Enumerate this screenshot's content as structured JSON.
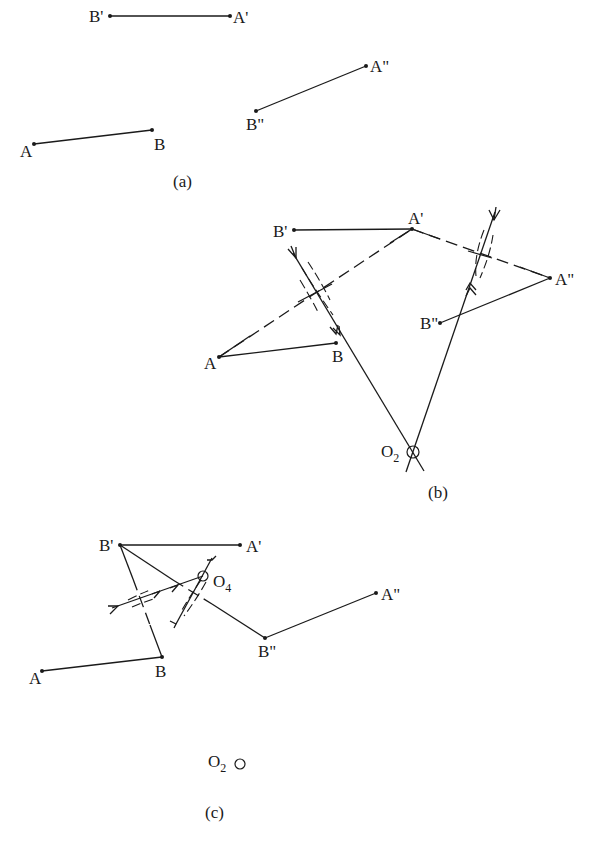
{
  "panels": [
    {
      "caption": "(a)",
      "points": {
        "A": "A",
        "B": "B",
        "A1": "A'",
        "B1": "B'",
        "A2": "A\"",
        "B2": "B\""
      }
    },
    {
      "caption": "(b)",
      "points": {
        "A": "A",
        "B": "B",
        "A1": "A'",
        "B1": "B'",
        "A2": "A\"",
        "B2": "B\""
      },
      "center": {
        "letter": "O",
        "subscript": "2"
      }
    },
    {
      "caption": "(c)",
      "points": {
        "A": "A",
        "B": "B",
        "A1": "A'",
        "B1": "B'",
        "A2": "A\"",
        "B2": "B\""
      },
      "center_found": {
        "letter": "O",
        "subscript": "4"
      },
      "center_prev": {
        "letter": "O",
        "subscript": "2"
      }
    }
  ],
  "colors": {
    "ink": "#1a1a1a",
    "background": "#ffffff"
  }
}
